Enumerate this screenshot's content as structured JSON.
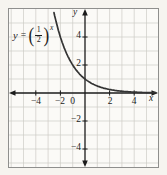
{
  "figure": {
    "equation": {
      "variable": "y",
      "equals": "=",
      "open_paren": "(",
      "numerator": "1",
      "denominator": "2",
      "close_paren": ")",
      "exponent": "x"
    },
    "labels": {
      "x_axis": "x",
      "y_axis": "y",
      "origin": "0",
      "x_ticks": [
        "−4",
        "−2",
        "2",
        "4"
      ],
      "y_ticks": [
        "4",
        "2",
        "−2",
        "−4"
      ]
    }
  },
  "chart_data": {
    "type": "line",
    "function": {
      "form": "exponential",
      "base": 0.5
    },
    "points": {
      "x": [
        -2,
        -1,
        0,
        1,
        2,
        3,
        4,
        5
      ],
      "y": [
        4,
        2,
        1,
        0.5,
        0.25,
        0.125,
        0.0625,
        0.03125
      ]
    },
    "xlabel": "x",
    "ylabel": "y",
    "xlim": [
      -6,
      6
    ],
    "ylim": [
      -5.6,
      6
    ],
    "x_ticks": [
      -4,
      -2,
      2,
      4
    ],
    "y_ticks": [
      -4,
      -2,
      2,
      4
    ],
    "grid": true,
    "grid_step": 1,
    "curve_color": "#333333",
    "axis_color": "#1b1b1b",
    "grid_color": "#cdccc6",
    "frame_color": "#8f8f8d"
  }
}
